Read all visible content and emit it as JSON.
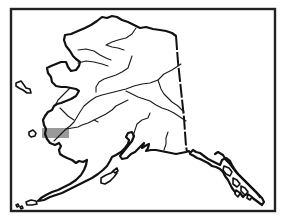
{
  "map": {
    "subject": "Alaska outline map",
    "frame": {
      "x": 11,
      "y": 9,
      "width": 264,
      "height": 202,
      "color": "#222222"
    },
    "highlight": {
      "label": "highlighted-region",
      "x": 42,
      "y": 128,
      "width": 27,
      "height": 10,
      "color": "#9a9a9a"
    },
    "colors": {
      "background": "#ffffff",
      "outline": "#111111"
    }
  }
}
